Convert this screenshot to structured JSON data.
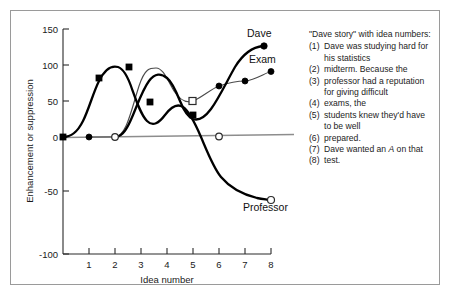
{
  "figure": {
    "background": "#ffffff",
    "frame_color": "#9a9a9a"
  },
  "story": {
    "title": "\"Dave story\" with idea numbers:",
    "lines": [
      {
        "num": "(1)",
        "text": "Dave was studying hard for"
      },
      {
        "num": "",
        "text": "his statistics",
        "cont": true
      },
      {
        "num": "(2)",
        "text": "midterm. Because the"
      },
      {
        "num": "(3)",
        "text": "professor had a reputation"
      },
      {
        "num": "",
        "text": "for giving difficult",
        "cont": true
      },
      {
        "num": "(4)",
        "text": "exams, the"
      },
      {
        "num": "(5)",
        "text": "students knew they'd have"
      },
      {
        "num": "",
        "text": "to be well",
        "cont": true
      },
      {
        "num": "(6)",
        "text": "prepared."
      },
      {
        "num": "(7)",
        "text": "Dave wanted an A on that",
        "italic_word": "A"
      },
      {
        "num": "(8)",
        "text": "test."
      }
    ]
  },
  "chart_data": {
    "type": "line",
    "title": "",
    "xlabel": "Idea number",
    "ylabel": "Enhancement or suppression",
    "xlim": [
      0,
      8.6
    ],
    "ylim": [
      -100,
      150
    ],
    "xticks": [
      1,
      2,
      3,
      4,
      5,
      6,
      7,
      8
    ],
    "yticks": [
      150,
      100,
      50,
      0,
      -50,
      -100
    ],
    "grid": false,
    "legend": "inline-labels",
    "zero_reference_line": {
      "y": 0,
      "color": "#8d8d8d"
    },
    "series": [
      {
        "name": "Professor",
        "label": "Professor",
        "color": "#000000",
        "weight": "heavy",
        "marker": "square-filled",
        "end_marker": "circle-open",
        "x": [
          0,
          2,
          3.3,
          4.15,
          5,
          6,
          8
        ],
        "values": [
          0,
          81,
          95,
          48,
          30,
          0,
          -47
        ]
      },
      {
        "name": "Exam",
        "label": "Exam",
        "color": "#4a4a4a",
        "weight": "light",
        "marker": "circle-filled",
        "x": [
          1,
          2,
          3.6,
          5,
          6,
          7,
          8
        ],
        "values": [
          0,
          0,
          96,
          50,
          71,
          78,
          91
        ]
      },
      {
        "name": "Dave",
        "label": "Dave",
        "color": "#000000",
        "weight": "heavy",
        "marker": "circle-filled",
        "x": [
          2,
          4.2,
          8
        ],
        "values": [
          0,
          82,
          125
        ]
      }
    ],
    "point_markers": [
      {
        "series": "Professor",
        "x": 0,
        "y": 0,
        "style": "square-filled"
      },
      {
        "series": "Professor",
        "x": 2,
        "y": 81,
        "style": "square-filled"
      },
      {
        "series": "Professor",
        "x": 3.3,
        "y": 95,
        "style": "square-filled"
      },
      {
        "series": "Professor",
        "x": 4.15,
        "y": 48,
        "style": "square-filled"
      },
      {
        "series": "Professor",
        "x": 5,
        "y": 30,
        "style": "square-filled"
      },
      {
        "series": "Professor",
        "x": 6,
        "y": 0,
        "style": "circle-open"
      },
      {
        "series": "Professor",
        "x": 8,
        "y": -47,
        "style": "circle-open"
      },
      {
        "series": "Exam",
        "x": 1,
        "y": 0,
        "style": "circle-filled"
      },
      {
        "series": "Exam",
        "x": 2,
        "y": 0,
        "style": "circle-open"
      },
      {
        "series": "Exam",
        "x": 5,
        "y": 50,
        "style": "square-open"
      },
      {
        "series": "Exam",
        "x": 6,
        "y": 71,
        "style": "circle-filled"
      },
      {
        "series": "Exam",
        "x": 7,
        "y": 78,
        "style": "circle-filled"
      },
      {
        "series": "Exam",
        "x": 8,
        "y": 91,
        "style": "circle-filled"
      },
      {
        "series": "Dave",
        "x": 8,
        "y": 125,
        "style": "circle-filled"
      }
    ]
  }
}
